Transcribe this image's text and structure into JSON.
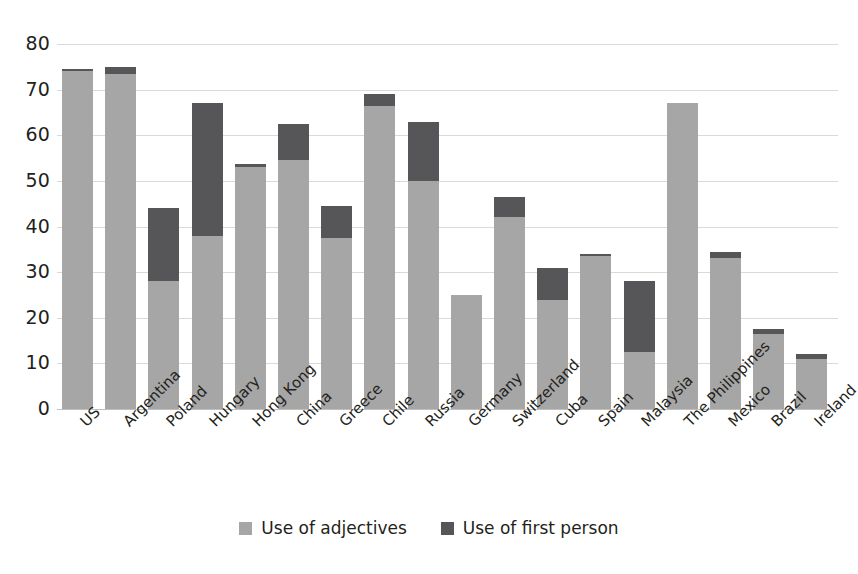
{
  "chart_data": {
    "type": "bar",
    "subtype": "stacked",
    "title": "",
    "xlabel": "",
    "ylabel": "",
    "ylim": [
      0,
      80
    ],
    "ytick_labels": [
      "80",
      "70",
      "60",
      "50",
      "40",
      "30",
      "20",
      "10",
      "0"
    ],
    "ytick_values": [
      80,
      70,
      60,
      50,
      40,
      30,
      20,
      10,
      0
    ],
    "grid": true,
    "legend_position": "bottom",
    "categories": [
      "US",
      "Argentina",
      "Poland",
      "Hungary",
      "Hong Kong",
      "China",
      "Greece",
      "Chile",
      "Russia",
      "Germany",
      "Switzerland",
      "Cuba",
      "Spain",
      "Malaysia",
      "The Philippines",
      "Mexico",
      "Brazil",
      "Ireland"
    ],
    "series": [
      {
        "name": "Use of adjectives",
        "color": "#a6a6a6",
        "values": [
          74.0,
          73.5,
          28.0,
          38.0,
          53.0,
          54.5,
          37.5,
          66.5,
          50.0,
          25.0,
          42.0,
          24.0,
          33.5,
          12.5,
          67.0,
          33.0,
          16.5,
          11.0
        ]
      },
      {
        "name": "Use of first person",
        "color": "#565658",
        "values": [
          0.5,
          1.5,
          16.0,
          29.0,
          0.7,
          8.0,
          7.0,
          2.5,
          13.0,
          0.0,
          4.5,
          7.0,
          0.5,
          15.5,
          0.0,
          1.5,
          1.0,
          1.0
        ]
      }
    ],
    "totals": [
      74.5,
      75.0,
      44.0,
      67.0,
      53.7,
      62.5,
      44.5,
      69.0,
      63.0,
      25.0,
      46.5,
      31.0,
      34.0,
      28.0,
      67.0,
      34.5,
      17.5,
      12.0
    ]
  },
  "legend": {
    "items": [
      {
        "label": "Use of adjectives",
        "color": "#a6a6a6"
      },
      {
        "label": "Use of first person",
        "color": "#565658"
      }
    ]
  }
}
